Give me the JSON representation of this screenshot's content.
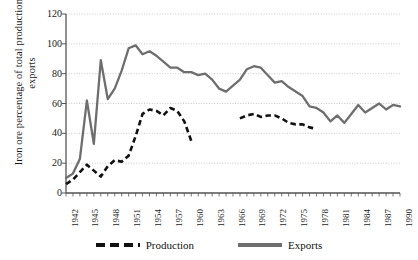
{
  "chart_data": {
    "type": "line",
    "title": "",
    "xlabel": "",
    "ylabel": "Iron ore percentage of total production and exports",
    "ylim": [
      0,
      120
    ],
    "ytick_values": [
      0,
      20,
      40,
      60,
      80,
      100,
      120
    ],
    "ytick_labels": [
      "0",
      "20",
      "40",
      "60",
      "80",
      "100",
      "120"
    ],
    "xlim": [
      1942,
      1990
    ],
    "xtick_labels": [
      "1942",
      "1945",
      "1948",
      "1951",
      "1954",
      "1957",
      "1960",
      "1963",
      "1966",
      "1969",
      "1972",
      "1975",
      "1978",
      "1981",
      "1984",
      "1987",
      "1990"
    ],
    "x_all_years": [
      1942,
      1943,
      1944,
      1945,
      1946,
      1947,
      1948,
      1949,
      1950,
      1951,
      1952,
      1953,
      1954,
      1955,
      1956,
      1957,
      1958,
      1959,
      1960,
      1961,
      1962,
      1963,
      1964,
      1965,
      1966,
      1967,
      1968,
      1969,
      1970,
      1971,
      1972,
      1973,
      1974,
      1975,
      1976,
      1977,
      1978,
      1979,
      1980,
      1981,
      1982,
      1983,
      1984,
      1985,
      1986,
      1987,
      1988,
      1989,
      1990
    ],
    "grid": true,
    "grid_axis": "y",
    "legend_position": "bottom",
    "series": [
      {
        "name": "Production",
        "style": "dashed",
        "color": "#111111",
        "x": [
          1942,
          1943,
          1944,
          1945,
          1946,
          1947,
          1948,
          1949,
          1950,
          1951,
          1952,
          1953,
          1954,
          1955,
          1956,
          1957,
          1958,
          1959,
          1960
        ],
        "values": [
          6,
          9,
          14,
          19,
          15,
          11,
          18,
          22,
          21,
          25,
          38,
          53,
          56,
          55,
          52,
          57,
          55,
          48,
          35
        ],
        "x2": [
          1967,
          1968,
          1969,
          1970,
          1971,
          1972,
          1973,
          1974,
          1975,
          1976,
          1977,
          1978
        ],
        "values2": [
          50,
          52,
          53,
          51,
          52,
          52,
          50,
          47,
          46,
          46,
          44,
          43
        ]
      },
      {
        "name": "Exports",
        "style": "solid",
        "color": "#666666",
        "x": [
          1942,
          1943,
          1944,
          1945,
          1946,
          1947,
          1948,
          1949,
          1950,
          1951,
          1952,
          1953,
          1954,
          1955,
          1956,
          1957,
          1958,
          1959,
          1960,
          1961,
          1962,
          1963,
          1964,
          1965,
          1966,
          1967,
          1968,
          1969,
          1970,
          1971,
          1972,
          1973,
          1974,
          1975,
          1976,
          1977,
          1978,
          1979,
          1980,
          1981,
          1982,
          1983,
          1984,
          1985,
          1986,
          1987,
          1988,
          1989,
          1990
        ],
        "values": [
          10,
          13,
          23,
          62,
          33,
          89,
          63,
          70,
          82,
          97,
          99,
          93,
          95,
          92,
          88,
          84,
          84,
          81,
          81,
          79,
          80,
          76,
          70,
          68,
          72,
          76,
          83,
          85,
          84,
          79,
          74,
          75,
          71,
          68,
          65,
          58,
          57,
          54,
          48,
          52,
          47,
          53,
          59,
          54,
          57,
          60,
          56,
          59,
          58
        ]
      }
    ]
  },
  "legend": {
    "production_label": "Production",
    "exports_label": "Exports"
  },
  "colors": {
    "production": "#111111",
    "exports": "#6e6e6e",
    "axis": "#555555",
    "grid": "#bbbbbb"
  }
}
